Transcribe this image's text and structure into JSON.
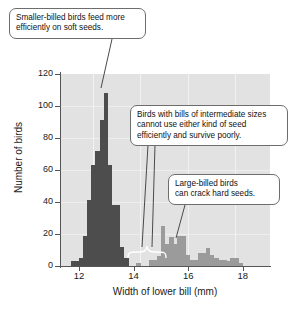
{
  "figure": {
    "name": "bill-width-histogram"
  },
  "chart_data": {
    "type": "bar",
    "title": "",
    "subtitle": "",
    "xlabel": "Width of lower bill (mm)",
    "ylabel": "Number of birds",
    "xlim": [
      11.3,
      19.0
    ],
    "ylim": [
      0,
      120
    ],
    "xticks": [
      "12",
      "14",
      "16",
      "18"
    ],
    "xtick_values": [
      12,
      14,
      16,
      18
    ],
    "yticks": [
      "0",
      "20",
      "40",
      "60",
      "80",
      "100",
      "120"
    ],
    "ytick_values": [
      0,
      20,
      40,
      60,
      80,
      100,
      120
    ],
    "grid": true,
    "legend": "none",
    "bin_width": 0.15,
    "colors": {
      "small_billed_bars": "#4d4d4d",
      "large_billed_bars": "#9b9b9b",
      "plot_background": "#e2e2e2",
      "gridline": "#f2f2f2",
      "axis": "#555555",
      "callout_border": "#6d6d6d",
      "callout_fill": "#ffffff"
    },
    "series": [
      {
        "name": "Small-billed morph",
        "color": "#4d4d4d",
        "x": [
          11.7,
          11.85,
          12.0,
          12.15,
          12.3,
          12.45,
          12.6,
          12.75,
          12.9,
          13.05,
          13.2,
          13.35,
          13.5,
          13.65
        ],
        "values": [
          3,
          3,
          5,
          19,
          41,
          63,
          72,
          91,
          108,
          63,
          38,
          38,
          12,
          5
        ]
      },
      {
        "name": "Intermediate (gap)",
        "color": "#9b9b9b",
        "x": [
          13.8,
          13.95,
          14.1,
          14.25,
          14.4,
          14.55,
          14.7,
          14.85
        ],
        "values": [
          0,
          0,
          2,
          0,
          0,
          4,
          4,
          6
        ]
      },
      {
        "name": "Large-billed morph",
        "color": "#9b9b9b",
        "x": [
          15.0,
          15.15,
          15.3,
          15.45,
          15.6,
          15.75,
          15.9,
          16.05,
          16.2,
          16.35,
          16.5,
          16.65,
          16.8,
          16.95,
          17.1,
          17.25,
          17.4,
          17.55,
          17.7,
          17.85
        ],
        "values": [
          25,
          14,
          18,
          14,
          19,
          19,
          7,
          4,
          4,
          8,
          8,
          11,
          7,
          5,
          4,
          4,
          3,
          5,
          5,
          2
        ]
      }
    ]
  },
  "annotations": [
    {
      "id": "callout-small-billed",
      "lines": [
        "Smaller-billed birds feed more",
        "efficiently on soft seeds."
      ]
    },
    {
      "id": "callout-intermediate",
      "lines": [
        "Birds with bills of intermediate sizes",
        "cannot use either kind of seed",
        "efficiently and survive poorly."
      ]
    },
    {
      "id": "callout-large-billed",
      "lines": [
        "Large-billed birds",
        "can crack hard seeds."
      ]
    }
  ]
}
